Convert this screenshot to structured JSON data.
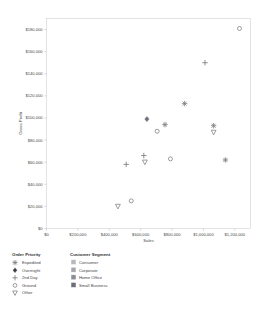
{
  "chart_data": {
    "type": "scatter",
    "title": "",
    "xlabel": "Sales",
    "ylabel": "Gross Profit",
    "xlim": [
      0,
      1300000
    ],
    "ylim": [
      0,
      190000
    ],
    "grid": false,
    "xticks": [
      0,
      200000,
      400000,
      600000,
      800000,
      1000000,
      1200000
    ],
    "xtick_labels": [
      "$0",
      "$200,000",
      "$400,000",
      "$600,000",
      "$800,000",
      "$1,000,000",
      "$1,200,000"
    ],
    "yticks": [
      0,
      20000,
      40000,
      60000,
      80000,
      100000,
      120000,
      140000,
      160000,
      180000
    ],
    "ytick_labels": [
      "$0",
      "$20,000",
      "$40,000",
      "$60,000",
      "$80,000",
      "$100,000",
      "$120,000",
      "$140,000",
      "$160,000",
      "$180,000"
    ],
    "points": [
      {
        "x": 1230000,
        "y": 181000,
        "priority": "Ground",
        "segment": "Consumer"
      },
      {
        "x": 1010000,
        "y": 150000,
        "priority": "2nd Day",
        "segment": "Consumer"
      },
      {
        "x": 880000,
        "y": 113000,
        "priority": "Expedited",
        "segment": "Corporate"
      },
      {
        "x": 640000,
        "y": 99000,
        "priority": "Overnight",
        "segment": "Small Business"
      },
      {
        "x": 755000,
        "y": 94000,
        "priority": "Expedited",
        "segment": "Corporate"
      },
      {
        "x": 1065000,
        "y": 93000,
        "priority": "Expedited",
        "segment": "Corporate"
      },
      {
        "x": 1065000,
        "y": 87000,
        "priority": "Other",
        "segment": "Home Office"
      },
      {
        "x": 705000,
        "y": 88000,
        "priority": "Ground",
        "segment": "Consumer"
      },
      {
        "x": 620000,
        "y": 66000,
        "priority": "2nd Day",
        "segment": "Corporate"
      },
      {
        "x": 627000,
        "y": 60000,
        "priority": "Other",
        "segment": "Home Office"
      },
      {
        "x": 790000,
        "y": 63000,
        "priority": "Ground",
        "segment": "Consumer"
      },
      {
        "x": 1140000,
        "y": 62000,
        "priority": "Expedited",
        "segment": "Corporate"
      },
      {
        "x": 508000,
        "y": 58000,
        "priority": "2nd Day",
        "segment": "Corporate"
      },
      {
        "x": 540000,
        "y": 25000,
        "priority": "Ground",
        "segment": "Consumer"
      },
      {
        "x": 455000,
        "y": 20000,
        "priority": "Other",
        "segment": "Home Office"
      }
    ],
    "legends": [
      {
        "title": "Order Priority",
        "encoding": "shape",
        "entries": [
          {
            "label": "Expedited",
            "marker": "star-marker"
          },
          {
            "label": "Overnight",
            "marker": "diamond-marker"
          },
          {
            "label": "2nd Day",
            "marker": "plus-marker"
          },
          {
            "label": "Ground",
            "marker": "circle-marker"
          },
          {
            "label": "Other",
            "marker": "triangle-down-marker"
          }
        ]
      },
      {
        "title": "Customer Segment",
        "encoding": "color",
        "entries": [
          {
            "label": "Consumer",
            "color": "#b9b9bd"
          },
          {
            "label": "Corporate",
            "color": "#a6a6ac"
          },
          {
            "label": "Home Office",
            "color": "#8d8d95"
          },
          {
            "label": "Small Business",
            "color": "#6e6e78"
          }
        ]
      }
    ]
  }
}
